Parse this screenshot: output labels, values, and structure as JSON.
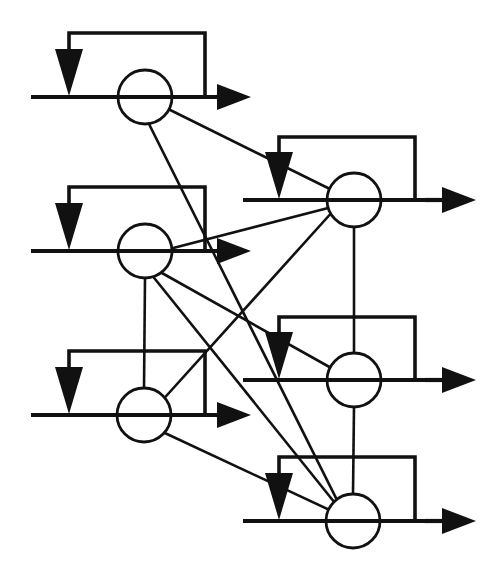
{
  "figure": {
    "kind": "network-diagram",
    "canvas": {
      "width": 498,
      "height": 579
    },
    "ink_color": "#111111",
    "background_color": "#ffffff"
  },
  "geometry": {
    "node_radius": 27,
    "wire_width": 4.2,
    "edge_width": 2.6,
    "loop_width": 3.6,
    "down_arrow": {
      "half_width": 14,
      "head_height": 47,
      "shaft_width": 4
    },
    "right_arrow": {
      "half_height": 13,
      "head_length": 34
    }
  },
  "nodes": [
    {
      "id": "L1",
      "label": "neuron-left-1",
      "cx": 145,
      "cy": 97,
      "column": "left"
    },
    {
      "id": "L2",
      "label": "neuron-left-2",
      "cx": 145,
      "cy": 251,
      "column": "left"
    },
    {
      "id": "L3",
      "label": "neuron-left-3",
      "cx": 144,
      "cy": 415,
      "column": "left"
    },
    {
      "id": "R1",
      "label": "neuron-right-1",
      "cx": 354,
      "cy": 200,
      "column": "right"
    },
    {
      "id": "R2",
      "label": "neuron-right-2",
      "cx": 354,
      "cy": 380,
      "column": "right"
    },
    {
      "id": "R3",
      "label": "neuron-right-3",
      "cx": 353,
      "cy": 521,
      "column": "right"
    }
  ],
  "input_wires": [
    {
      "node": "L1",
      "x_start": 31,
      "x_end": 216,
      "y": 97
    },
    {
      "node": "L2",
      "x_start": 31,
      "x_end": 216,
      "y": 251
    },
    {
      "node": "L3",
      "x_start": 31,
      "x_end": 216,
      "y": 415
    },
    {
      "node": "R1",
      "x_start": 243,
      "x_end": 425,
      "y": 200
    },
    {
      "node": "R2",
      "x_start": 243,
      "x_end": 425,
      "y": 380
    },
    {
      "node": "R3",
      "x_start": 243,
      "x_end": 425,
      "y": 521
    }
  ],
  "output_arrows": [
    {
      "node": "L1",
      "x_tail": 216,
      "x_tip": 251,
      "y": 97
    },
    {
      "node": "L2",
      "x_tail": 216,
      "x_tip": 251,
      "y": 251
    },
    {
      "node": "L3",
      "x_tail": 216,
      "x_tip": 251,
      "y": 415
    },
    {
      "node": "R1",
      "x_tail": 425,
      "x_tip": 476,
      "y": 200
    },
    {
      "node": "R2",
      "x_tail": 425,
      "x_tip": 476,
      "y": 380
    },
    {
      "node": "R3",
      "x_tail": 425,
      "x_tip": 476,
      "y": 521
    }
  ],
  "feedback_loops": [
    {
      "node": "L1",
      "tap_x": 205,
      "wire_y": 97,
      "top_y": 33,
      "return_x": 69,
      "tip_y": 96
    },
    {
      "node": "L2",
      "tap_x": 205,
      "wire_y": 251,
      "top_y": 187,
      "return_x": 69,
      "tip_y": 250
    },
    {
      "node": "L3",
      "tap_x": 205,
      "wire_y": 415,
      "top_y": 351,
      "return_x": 69,
      "tip_y": 414
    },
    {
      "node": "R1",
      "tap_x": 415,
      "wire_y": 200,
      "top_y": 137,
      "return_x": 279,
      "tip_y": 199
    },
    {
      "node": "R2",
      "tap_x": 415,
      "wire_y": 380,
      "top_y": 317,
      "return_x": 279,
      "tip_y": 379
    },
    {
      "node": "R3",
      "tap_x": 415,
      "wire_y": 521,
      "top_y": 457,
      "return_x": 279,
      "tip_y": 520
    }
  ],
  "edges": [
    {
      "id": "e1",
      "from": "L1",
      "to": "R1",
      "x1": 150,
      "y1": 100,
      "x2": 338,
      "y2": 193
    },
    {
      "id": "e2",
      "from": "L1",
      "to": "R3",
      "x1": 148,
      "y1": 122,
      "x2": 343,
      "y2": 512
    },
    {
      "id": "e3",
      "from": "L2",
      "to": "R1",
      "x1": 150,
      "y1": 254,
      "x2": 332,
      "y2": 207
    },
    {
      "id": "e4",
      "from": "L2",
      "to": "R2",
      "x1": 153,
      "y1": 268,
      "x2": 333,
      "y2": 369
    },
    {
      "id": "e5",
      "from": "L2",
      "to": "R3",
      "x1": 151,
      "y1": 274,
      "x2": 339,
      "y2": 508
    },
    {
      "id": "e6",
      "from": "L3",
      "to": "R1",
      "x1": 150,
      "y1": 414,
      "x2": 334,
      "y2": 210
    },
    {
      "id": "e7",
      "from": "L3",
      "to": "R3",
      "x1": 152,
      "y1": 427,
      "x2": 336,
      "y2": 513
    },
    {
      "id": "e8",
      "from": "L2",
      "to": "L3",
      "x1": 145,
      "y1": 278,
      "x2": 144,
      "y2": 388
    },
    {
      "id": "e9",
      "from": "R1",
      "to": "R2",
      "x1": 354,
      "y1": 227,
      "x2": 354,
      "y2": 353
    },
    {
      "id": "e10",
      "from": "R2",
      "to": "R3",
      "x1": 354,
      "y1": 407,
      "x2": 353,
      "y2": 494
    }
  ],
  "legend": {
    "node_label": "neuron",
    "loop_label": "self-feedback loop",
    "edge_label": "inter-neuron connection",
    "input_label": "input wire",
    "output_label": "output arrow"
  }
}
